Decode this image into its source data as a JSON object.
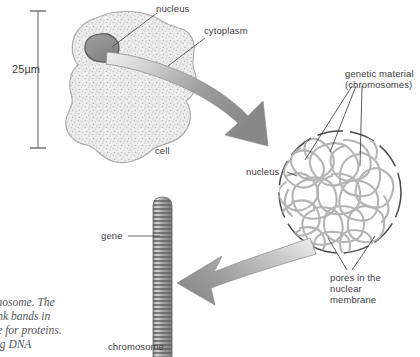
{
  "figure": {
    "background_color": "#ffffff",
    "scale": {
      "label": "25µm",
      "bar_name": "scale-bar"
    },
    "labels": {
      "nucleus_cell": "nucleus",
      "cytoplasm": "cytoplasm",
      "cell": "cell",
      "genetic_material_line1": "genetic material",
      "genetic_material_line2": "(chromosomes)",
      "nucleus_big": "nucleus",
      "pores_line1": "pores in the",
      "pores_line2": "nuclear",
      "pores_line3": "membrane",
      "gene": "gene",
      "chromosome": "chromosome"
    },
    "caption": {
      "line1": "mosome. The",
      "line2": "ink bands in",
      "line3": "le for proteins.",
      "line4": "ng DNA"
    },
    "colors": {
      "cell_fill": "#e8e8e6",
      "cell_stroke": "#a9a9a7",
      "nucleus_fill": "#8d8d8b",
      "nucleus_stroke": "#56565a",
      "arrow_dark": "#8a8a8a",
      "arrow_light": "#e4e4e4",
      "chromatin": "#b4b4b2",
      "dash_circle": "#4a4a4a",
      "chromosome_band": "#6e6e6e",
      "leader_line": "#4a4a4a",
      "text": "#3d3d3d",
      "caption_text": "#53565a"
    }
  }
}
